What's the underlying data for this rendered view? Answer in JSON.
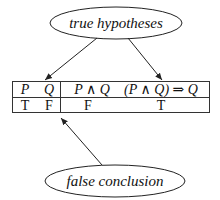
{
  "diagram": {
    "top_label": "true hypotheses",
    "bottom_label": "false conclusion",
    "table": {
      "headers": [
        "P",
        "Q",
        "P ∧ Q",
        "(P ∧ Q) ⇒ Q"
      ],
      "header_parts": {
        "p": "P",
        "q": "Q",
        "p_and_q": "P ∧ Q",
        "implication": "(P ∧ Q) ⇒ Q"
      },
      "rows": [
        {
          "P": "T",
          "Q": "F",
          "P_and_Q": "F",
          "implication": "T"
        }
      ]
    },
    "arrows": [
      {
        "from": "true hypotheses",
        "to": "P Q columns"
      },
      {
        "from": "true hypotheses",
        "to": "(P ∧ Q) ⇒ Q column"
      },
      {
        "from": "false conclusion",
        "to": "table divider / P ∧ Q value"
      }
    ],
    "colors": {
      "stroke": "#222222",
      "background": "#ffffff"
    }
  }
}
